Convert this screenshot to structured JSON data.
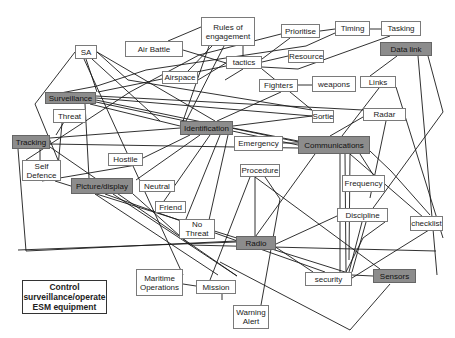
{
  "diagram": {
    "title": "Control surveillance/operate ESM equipment",
    "colors": {
      "primary_node_fill": "#8c8c8c",
      "node_fill": "#ffffff",
      "line": "#1a1a1a"
    },
    "nodes": [
      {
        "id": "rules",
        "label": "Rules of\nengagement",
        "x": 201,
        "y": 17,
        "w": 54,
        "h": 29,
        "primary": false
      },
      {
        "id": "airbattle",
        "label": "Air Battle",
        "x": 125,
        "y": 41,
        "w": 58,
        "h": 16,
        "primary": false
      },
      {
        "id": "sa",
        "label": "SA",
        "x": 75,
        "y": 45,
        "w": 22,
        "h": 14,
        "primary": false
      },
      {
        "id": "prioritise",
        "label": "Prioritise",
        "x": 281,
        "y": 24,
        "w": 39,
        "h": 14,
        "primary": false
      },
      {
        "id": "timing",
        "label": "Timing",
        "x": 335,
        "y": 21,
        "w": 35,
        "h": 15,
        "primary": false
      },
      {
        "id": "tasking",
        "label": "Tasking",
        "x": 381,
        "y": 21,
        "w": 40,
        "h": 15,
        "primary": false
      },
      {
        "id": "tactics",
        "label": "tactics",
        "x": 226,
        "y": 56,
        "w": 36,
        "h": 13,
        "primary": false
      },
      {
        "id": "resource",
        "label": "Resource",
        "x": 288,
        "y": 50,
        "w": 36,
        "h": 13,
        "primary": false
      },
      {
        "id": "datalink",
        "label": "Data link",
        "x": 380,
        "y": 42,
        "w": 52,
        "h": 14,
        "primary": true
      },
      {
        "id": "airspace",
        "label": "Airspace",
        "x": 162,
        "y": 71,
        "w": 36,
        "h": 13,
        "primary": false
      },
      {
        "id": "fighters",
        "label": "Fighters",
        "x": 259,
        "y": 79,
        "w": 39,
        "h": 13,
        "primary": false
      },
      {
        "id": "weapons",
        "label": "weapons",
        "x": 312,
        "y": 76,
        "w": 44,
        "h": 16,
        "primary": false
      },
      {
        "id": "links",
        "label": "Links",
        "x": 360,
        "y": 76,
        "w": 36,
        "h": 12,
        "primary": false
      },
      {
        "id": "surveillance",
        "label": "Surveillance",
        "x": 45,
        "y": 92,
        "w": 51,
        "h": 12,
        "primary": true
      },
      {
        "id": "threat",
        "label": "Threat",
        "x": 53,
        "y": 109,
        "w": 33,
        "h": 14,
        "primary": false
      },
      {
        "id": "sortie",
        "label": "Sortie",
        "x": 312,
        "y": 110,
        "w": 22,
        "h": 13,
        "primary": false
      },
      {
        "id": "radar",
        "label": "Radar",
        "x": 363,
        "y": 108,
        "w": 43,
        "h": 13,
        "primary": false
      },
      {
        "id": "identification",
        "label": "Identification",
        "x": 180,
        "y": 121,
        "w": 53,
        "h": 14,
        "primary": true
      },
      {
        "id": "tracking",
        "label": "Tracking",
        "x": 12,
        "y": 135,
        "w": 38,
        "h": 14,
        "primary": true
      },
      {
        "id": "emergency",
        "label": "Emergency",
        "x": 234,
        "y": 136,
        "w": 49,
        "h": 15,
        "primary": false
      },
      {
        "id": "communications",
        "label": "Communications",
        "x": 298,
        "y": 136,
        "w": 72,
        "h": 18,
        "primary": true
      },
      {
        "id": "hostile",
        "label": "Hostile",
        "x": 108,
        "y": 153,
        "w": 35,
        "h": 13,
        "primary": false
      },
      {
        "id": "selfdefence",
        "label": "Self\nDefence",
        "x": 22,
        "y": 160,
        "w": 39,
        "h": 21,
        "primary": false
      },
      {
        "id": "procedure",
        "label": "Procedure",
        "x": 240,
        "y": 164,
        "w": 40,
        "h": 13,
        "primary": false
      },
      {
        "id": "picture",
        "label": "Picture/display",
        "x": 71,
        "y": 178,
        "w": 62,
        "h": 16,
        "primary": true
      },
      {
        "id": "neutral",
        "label": "Neutral",
        "x": 139,
        "y": 180,
        "w": 36,
        "h": 12,
        "primary": false
      },
      {
        "id": "frequency",
        "label": "Frequency",
        "x": 342,
        "y": 175,
        "w": 43,
        "h": 17,
        "primary": false
      },
      {
        "id": "friend",
        "label": "Friend",
        "x": 155,
        "y": 201,
        "w": 31,
        "h": 12,
        "primary": false
      },
      {
        "id": "nothreat",
        "label": "No\nThreat",
        "x": 179,
        "y": 219,
        "w": 36,
        "h": 20,
        "primary": false
      },
      {
        "id": "discipline",
        "label": "Discipline",
        "x": 337,
        "y": 208,
        "w": 51,
        "h": 14,
        "primary": false
      },
      {
        "id": "checklist",
        "label": "checklist",
        "x": 410,
        "y": 216,
        "w": 33,
        "h": 15,
        "primary": false
      },
      {
        "id": "radio",
        "label": "Radio",
        "x": 236,
        "y": 236,
        "w": 40,
        "h": 14,
        "primary": true
      },
      {
        "id": "maritime",
        "label": "Maritime\nOperations",
        "x": 136,
        "y": 269,
        "w": 47,
        "h": 27,
        "primary": false
      },
      {
        "id": "mission",
        "label": "Mission",
        "x": 196,
        "y": 280,
        "w": 40,
        "h": 14,
        "primary": false
      },
      {
        "id": "security",
        "label": "security",
        "x": 305,
        "y": 272,
        "w": 47,
        "h": 14,
        "primary": false
      },
      {
        "id": "sensors",
        "label": "Sensors",
        "x": 373,
        "y": 269,
        "w": 43,
        "h": 14,
        "primary": true
      },
      {
        "id": "warning",
        "label": "Warning\nAlert",
        "x": 233,
        "y": 305,
        "w": 36,
        "h": 24,
        "primary": false
      },
      {
        "id": "legend",
        "label": "Control\nsurveillance/operate\nESM equipment",
        "x": 22,
        "y": 280,
        "w": 85,
        "h": 34,
        "primary": false
      }
    ],
    "edges": [
      [
        201,
        27,
        168,
        41
      ],
      [
        212,
        46,
        188,
        71
      ],
      [
        243,
        46,
        243,
        56
      ],
      [
        224,
        46,
        186,
        121
      ],
      [
        209,
        46,
        183,
        121
      ],
      [
        183,
        50,
        226,
        63
      ],
      [
        86,
        59,
        97,
        92
      ],
      [
        75,
        52,
        35,
        104
      ],
      [
        35,
        104,
        58,
        160
      ],
      [
        97,
        52,
        128,
        80
      ],
      [
        128,
        80,
        312,
        110
      ],
      [
        92,
        59,
        160,
        121
      ],
      [
        84,
        59,
        183,
        275
      ],
      [
        97,
        52,
        215,
        121
      ],
      [
        320,
        31,
        335,
        29
      ],
      [
        370,
        29,
        381,
        29
      ],
      [
        281,
        34,
        199,
        55
      ],
      [
        199,
        55,
        130,
        92
      ],
      [
        130,
        92,
        26,
        160
      ],
      [
        290,
        38,
        262,
        59
      ],
      [
        262,
        62,
        288,
        56
      ],
      [
        262,
        67,
        298,
        69
      ],
      [
        298,
        69,
        390,
        36
      ],
      [
        335,
        33,
        306,
        46
      ],
      [
        306,
        46,
        146,
        70
      ],
      [
        146,
        70,
        97,
        86
      ],
      [
        97,
        86,
        45,
        96
      ],
      [
        243,
        69,
        225,
        80
      ],
      [
        262,
        69,
        312,
        110
      ],
      [
        226,
        66,
        98,
        92
      ],
      [
        226,
        63,
        198,
        80
      ],
      [
        298,
        85,
        312,
        85
      ],
      [
        281,
        92,
        217,
        121
      ],
      [
        379,
        88,
        342,
        136
      ],
      [
        396,
        87,
        443,
        238
      ],
      [
        397,
        56,
        370,
        76
      ],
      [
        418,
        56,
        437,
        275
      ],
      [
        428,
        56,
        443,
        112
      ],
      [
        443,
        112,
        368,
        215
      ],
      [
        368,
        215,
        352,
        272
      ],
      [
        96,
        96,
        363,
        110
      ],
      [
        96,
        98,
        312,
        116
      ],
      [
        96,
        100,
        313,
        145
      ],
      [
        96,
        102,
        298,
        145
      ],
      [
        90,
        104,
        180,
        126
      ],
      [
        85,
        104,
        89,
        178
      ],
      [
        72,
        109,
        56,
        135
      ],
      [
        62,
        123,
        57,
        178
      ],
      [
        363,
        117,
        330,
        136
      ],
      [
        386,
        121,
        370,
        198
      ],
      [
        233,
        128,
        298,
        141
      ],
      [
        233,
        126,
        312,
        116
      ],
      [
        190,
        135,
        143,
        158
      ],
      [
        200,
        135,
        136,
        180
      ],
      [
        210,
        135,
        164,
        201
      ],
      [
        220,
        135,
        186,
        219
      ],
      [
        228,
        135,
        205,
        238
      ],
      [
        50,
        138,
        180,
        128
      ],
      [
        50,
        144,
        298,
        148
      ],
      [
        50,
        147,
        237,
        276
      ],
      [
        18,
        149,
        26,
        251
      ],
      [
        26,
        251,
        236,
        241
      ],
      [
        40,
        149,
        40,
        160
      ],
      [
        42,
        181,
        142,
        164
      ],
      [
        55,
        181,
        345,
        272
      ],
      [
        283,
        143,
        298,
        143
      ],
      [
        370,
        151,
        391,
        171
      ],
      [
        391,
        171,
        430,
        215
      ],
      [
        315,
        154,
        253,
        240
      ],
      [
        340,
        154,
        340,
        272
      ],
      [
        345,
        154,
        346,
        272
      ],
      [
        350,
        154,
        349,
        260
      ],
      [
        350,
        154,
        438,
        230
      ],
      [
        360,
        154,
        374,
        176
      ],
      [
        255,
        164,
        255,
        245
      ],
      [
        265,
        177,
        280,
        199
      ],
      [
        280,
        199,
        261,
        305
      ],
      [
        255,
        177,
        380,
        269
      ],
      [
        250,
        177,
        210,
        280
      ],
      [
        113,
        194,
        237,
        276
      ],
      [
        105,
        194,
        325,
        272
      ],
      [
        95,
        194,
        218,
        275
      ],
      [
        133,
        194,
        190,
        245
      ],
      [
        190,
        245,
        436,
        251
      ],
      [
        276,
        244,
        337,
        216
      ],
      [
        362,
        222,
        349,
        272
      ],
      [
        274,
        246,
        313,
        272
      ],
      [
        236,
        242,
        18,
        250
      ],
      [
        385,
        222,
        363,
        238
      ],
      [
        363,
        238,
        346,
        272
      ],
      [
        183,
        284,
        196,
        286
      ],
      [
        222,
        294,
        222,
        300
      ],
      [
        390,
        284,
        350,
        330
      ],
      [
        350,
        330,
        220,
        262
      ],
      [
        352,
        275,
        373,
        276
      ],
      [
        437,
        225,
        352,
        278
      ]
    ]
  }
}
